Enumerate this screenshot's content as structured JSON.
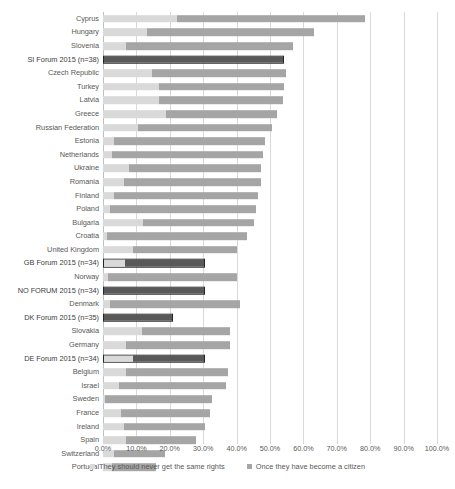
{
  "chart_data": {
    "type": "bar",
    "orientation": "horizontal",
    "stacked": true,
    "title": "",
    "xlabel": "",
    "ylabel": "",
    "xlim": [
      0,
      100
    ],
    "xtick_labels": [
      "0.0%",
      "10.0%",
      "20.0%",
      "30.0%",
      "40.0%",
      "50.0%",
      "60.0%",
      "70.0%",
      "80.0%",
      "90.0%",
      "100.0%"
    ],
    "xticks": [
      0,
      10,
      20,
      30,
      40,
      50,
      60,
      70,
      80,
      90,
      100
    ],
    "grid": true,
    "legend_position": "bottom",
    "series": [
      {
        "name": "They should never get the same rights",
        "color": "#d9d9d9"
      },
      {
        "name": "Once they have become a citizen",
        "color": "#a5a5a5"
      }
    ],
    "categories": [
      "Cyprus",
      "Hungary",
      "Slovenia",
      "SI Forum 2015 (n=38)",
      "Czech Republic",
      "Turkey",
      "Latvia",
      "Greece",
      "Russian Federation",
      "Estonia",
      "Netherlands",
      "Ukraine",
      "Romania",
      "Finland",
      "Poland",
      "Bulgaria",
      "Croatia",
      "United Kingdom",
      "GB Forum 2015 (n=34)",
      "Norway",
      "NO FORUM 2015 (n=34)",
      "Denmark",
      "DK Forum 2015 (n=35)",
      "Slovakia",
      "Germany",
      "DE Forum 2015 (n=34)",
      "Belgium",
      "Israel",
      "Sweden",
      "France",
      "Ireland",
      "Spain",
      "Switzerland",
      "Portugal"
    ],
    "rows": [
      {
        "label": "Cyprus",
        "never": 21.0,
        "citizen": 53.5,
        "total": 74.5,
        "highlight": false
      },
      {
        "label": "Hungary",
        "never": 12.5,
        "citizen": 47.5,
        "total": 60.0,
        "highlight": false
      },
      {
        "label": "Slovenia",
        "never": 6.5,
        "citizen": 47.5,
        "total": 54.0,
        "highlight": false
      },
      {
        "label": "SI Forum 2015 (n=38)",
        "never": 0.0,
        "citizen": 51.5,
        "total": 51.5,
        "highlight": true
      },
      {
        "label": "Czech Republic",
        "never": 14.0,
        "citizen": 38.0,
        "total": 52.0,
        "highlight": false
      },
      {
        "label": "Turkey",
        "never": 16.0,
        "citizen": 35.5,
        "total": 51.5,
        "highlight": false
      },
      {
        "label": "Latvia",
        "never": 16.0,
        "citizen": 35.0,
        "total": 51.0,
        "highlight": false
      },
      {
        "label": "Greece",
        "never": 18.0,
        "citizen": 31.5,
        "total": 49.5,
        "highlight": false
      },
      {
        "label": "Russian Federation",
        "never": 10.0,
        "citizen": 38.0,
        "total": 48.0,
        "highlight": false
      },
      {
        "label": "Estonia",
        "never": 3.0,
        "citizen": 43.0,
        "total": 46.0,
        "highlight": false
      },
      {
        "label": "Netherlands",
        "never": 2.5,
        "citizen": 43.0,
        "total": 45.5,
        "highlight": false
      },
      {
        "label": "Ukraine",
        "never": 7.5,
        "citizen": 37.5,
        "total": 45.0,
        "highlight": false
      },
      {
        "label": "Romania",
        "never": 6.0,
        "citizen": 39.0,
        "total": 45.0,
        "highlight": false
      },
      {
        "label": "Finland",
        "never": 3.0,
        "citizen": 41.0,
        "total": 44.0,
        "highlight": false
      },
      {
        "label": "Poland",
        "never": 2.0,
        "citizen": 41.5,
        "total": 43.5,
        "highlight": false
      },
      {
        "label": "Bulgaria",
        "never": 11.5,
        "citizen": 31.5,
        "total": 43.0,
        "highlight": false
      },
      {
        "label": "Croatia",
        "never": 1.0,
        "citizen": 40.0,
        "total": 41.0,
        "highlight": false
      },
      {
        "label": "United Kingdom",
        "never": 8.5,
        "citizen": 29.5,
        "total": 38.0,
        "highlight": false
      },
      {
        "label": "GB Forum 2015 (n=34)",
        "never": 6.0,
        "citizen": 23.0,
        "total": 29.0,
        "highlight": true
      },
      {
        "label": "Norway",
        "never": 1.5,
        "citizen": 36.5,
        "total": 38.0,
        "highlight": false
      },
      {
        "label": "NO FORUM 2015 (n=34)",
        "never": 0.0,
        "citizen": 29.0,
        "total": 29.0,
        "highlight": true
      },
      {
        "label": "Denmark",
        "never": 2.0,
        "citizen": 37.0,
        "total": 39.0,
        "highlight": false
      },
      {
        "label": "DK Forum 2015 (n=35)",
        "never": 0.0,
        "citizen": 20.0,
        "total": 20.0,
        "highlight": true
      },
      {
        "label": "Slovakia",
        "never": 11.0,
        "citizen": 25.0,
        "total": 36.0,
        "highlight": false
      },
      {
        "label": "Germany",
        "never": 6.5,
        "citizen": 29.5,
        "total": 36.0,
        "highlight": false
      },
      {
        "label": "DE Forum 2015 (n=34)",
        "never": 8.5,
        "citizen": 20.5,
        "total": 29.0,
        "highlight": true
      },
      {
        "label": "Belgium",
        "never": 6.5,
        "citizen": 29.0,
        "total": 35.5,
        "highlight": false
      },
      {
        "label": "Israel",
        "never": 4.5,
        "citizen": 30.5,
        "total": 35.0,
        "highlight": false
      },
      {
        "label": "Sweden",
        "never": 0.5,
        "citizen": 30.5,
        "total": 31.0,
        "highlight": false
      },
      {
        "label": "France",
        "never": 5.0,
        "citizen": 25.5,
        "total": 30.5,
        "highlight": false
      },
      {
        "label": "Ireland",
        "never": 6.0,
        "citizen": 23.0,
        "total": 29.0,
        "highlight": false
      },
      {
        "label": "Spain",
        "never": 6.5,
        "citizen": 20.0,
        "total": 26.5,
        "highlight": false
      },
      {
        "label": "Switzerland",
        "never": 3.0,
        "citizen": 14.5,
        "total": 17.5,
        "highlight": false
      },
      {
        "label": "Portugal",
        "never": 2.5,
        "citizen": 12.5,
        "total": 15.0,
        "highlight": false
      }
    ]
  },
  "legend": {
    "items": [
      {
        "label": "They should never get the same rights",
        "color": "#d9d9d9"
      },
      {
        "label": "Once they have become a citizen",
        "color": "#a5a5a5"
      }
    ]
  }
}
